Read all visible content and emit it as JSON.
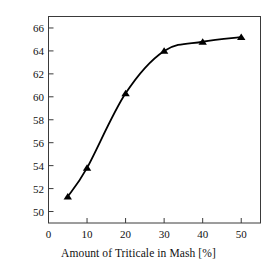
{
  "chart_data": {
    "type": "line",
    "title": "",
    "xlabel": "Amount of Triticale in Mash [%]",
    "ylabel": "LA per 100 kg FS in Mash",
    "xlim": [
      0,
      55
    ],
    "ylim": [
      49,
      67
    ],
    "xticks": [
      0,
      10,
      20,
      30,
      40,
      50
    ],
    "yticks": [
      50,
      52,
      54,
      56,
      58,
      60,
      62,
      64,
      66
    ],
    "xtick_labels": [
      "0",
      "10",
      "20",
      "30",
      "40",
      "50"
    ],
    "ytick_labels": [
      "50",
      "52",
      "54",
      "56",
      "58",
      "60",
      "62",
      "64",
      "66"
    ],
    "grid": false,
    "legend": null,
    "marker": "triangle",
    "marker_color": "#000000",
    "line_color": "#000000",
    "frame": "box",
    "x": [
      5,
      10,
      20,
      30,
      40,
      50
    ],
    "values": [
      51.3,
      53.8,
      60.3,
      64.0,
      64.8,
      65.2
    ],
    "series": [
      {
        "name": "LA per 100 kg FS in Mash",
        "x": [
          5,
          10,
          20,
          30,
          40,
          50
        ],
        "values": [
          51.3,
          53.8,
          60.3,
          64.0,
          64.8,
          65.2
        ]
      }
    ]
  },
  "figure": {
    "background": "#ffffff",
    "axis_color": "#333333"
  }
}
